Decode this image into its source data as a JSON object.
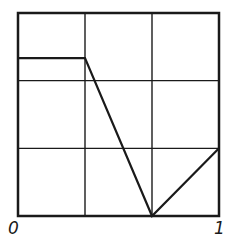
{
  "chart_data": {
    "type": "line",
    "title": "",
    "xlabel": "",
    "ylabel": "",
    "x_tick_labels": [
      "0",
      "1"
    ],
    "xlim": [
      0,
      1
    ],
    "ylim": [
      0,
      1
    ],
    "grid": {
      "on": true,
      "divisions": 3
    },
    "legend": null,
    "series": [
      {
        "name": "piecewise-linear function",
        "x": [
          0,
          0.3333,
          0.6667,
          1
        ],
        "y": [
          0.7778,
          0.7778,
          0,
          0.3333
        ]
      }
    ]
  },
  "colors": {
    "line": "#1a1a1a",
    "background": "#ffffff"
  }
}
